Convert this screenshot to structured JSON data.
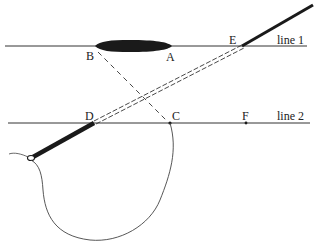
{
  "diagram": {
    "lines": [
      {
        "id": "line1",
        "label": "line 1",
        "y": 46,
        "x1": 5,
        "x2": 307
      },
      {
        "id": "line2",
        "label": "line 2",
        "y": 123,
        "x1": 8,
        "x2": 310
      }
    ],
    "points": {
      "A": {
        "label": "A",
        "x": 170,
        "y": 46
      },
      "B": {
        "label": "B",
        "x": 95,
        "y": 46
      },
      "C": {
        "label": "C",
        "x": 170,
        "y": 123
      },
      "D": {
        "label": "D",
        "x": 93,
        "y": 123
      },
      "E": {
        "label": "E",
        "x": 242,
        "y": 46
      },
      "F": {
        "label": "F",
        "x": 246,
        "y": 123
      }
    },
    "colors": {
      "ink": "#222222",
      "background": "#ffffff"
    }
  }
}
